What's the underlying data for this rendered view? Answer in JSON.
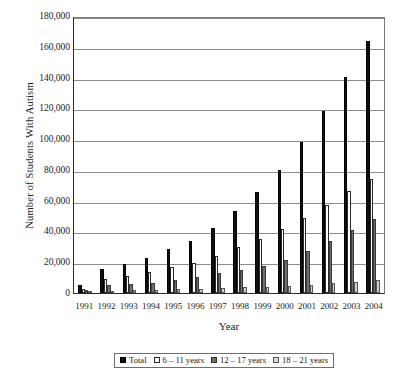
{
  "chart_data": {
    "type": "bar",
    "title": "",
    "xlabel": "Year",
    "ylabel": "Number of Students With Autism",
    "categories": [
      "1991",
      "1992",
      "1993",
      "1994",
      "1995",
      "1996",
      "1997",
      "1998",
      "1999",
      "2000",
      "2001",
      "2002",
      "2003",
      "2004"
    ],
    "ylim": [
      0,
      180000
    ],
    "ytick_step": 20000,
    "ytick_labels": [
      "180,000",
      "160,000",
      "140,000",
      "120,000",
      "100,000",
      "80,000",
      "60,000",
      "40,000",
      "20,000",
      "0"
    ],
    "grid": "horizontal",
    "legend_position": "bottom",
    "series": [
      {
        "name": "Total",
        "fill": "#111111",
        "values": [
          5415,
          15580,
          19058,
          22780,
          28813,
          34101,
          42517,
          53561,
          65396,
          79828,
          97904,
          118602,
          140254,
          163773
        ]
      },
      {
        "name": "6 – 11 years",
        "fill": "#ffffff",
        "values": [
          2900,
          9100,
          11100,
          13400,
          17000,
          19800,
          24200,
          29800,
          35000,
          41500,
          49000,
          57500,
          66000,
          74000
        ]
      },
      {
        "name": "12 – 17 years",
        "fill": "#6e6e6e",
        "values": [
          1800,
          4900,
          6000,
          6800,
          8600,
          10400,
          12800,
          14800,
          17500,
          21500,
          27500,
          33500,
          41000,
          48000
        ]
      },
      {
        "name": "18 – 21 years",
        "fill": "#d8d8d8",
        "values": [
          500,
          1100,
          1900,
          2100,
          2400,
          2700,
          3100,
          3600,
          4200,
          4800,
          5500,
          6300,
          7200,
          8300
        ]
      }
    ]
  },
  "axis": {
    "y_title": "Number of Students With Autism",
    "x_title": "Year"
  },
  "legend": {
    "items": [
      {
        "label": "Total"
      },
      {
        "label": "6 – 11 years"
      },
      {
        "label": "12 – 17 years"
      },
      {
        "label": "18 – 21 years"
      }
    ]
  }
}
